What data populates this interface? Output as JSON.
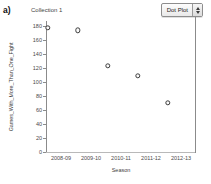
{
  "panel": {
    "label": "a)"
  },
  "collection": {
    "title": "Collection 1"
  },
  "plot_type_control": {
    "value": "Dot Plot",
    "stepper_up": "▲",
    "stepper_down": "▼"
  },
  "chart_data": {
    "type": "scatter",
    "title": "Collection 1",
    "xlabel": "Season",
    "ylabel": "Games_With_More_Than_One_Fight",
    "categories": [
      "2008-09",
      "2009-10",
      "2010-11",
      "2011-12",
      "2012-13"
    ],
    "values": [
      177,
      174,
      123,
      109,
      70
    ],
    "ylim": [
      0,
      180
    ],
    "yticks": [
      0,
      20,
      40,
      60,
      80,
      100,
      120,
      140,
      160,
      180
    ],
    "ytick_labels": [
      "0",
      "20",
      "40",
      "60",
      "80",
      "100",
      "120",
      "140",
      "160",
      "180"
    ],
    "grid": false,
    "legend": false,
    "marker": "open-circle",
    "marker_color": "#3c3c3c"
  }
}
